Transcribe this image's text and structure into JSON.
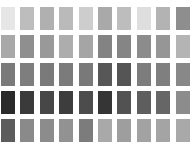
{
  "grid": {
    "rows": 5,
    "columns": 10,
    "swatches": [
      [
        "#e6e6e6",
        "#bdbdbd",
        "#b0b0b0",
        "#bababa",
        "#cdcdcd",
        "#a9a9a9",
        "#bdbdbd",
        "#dedede",
        "#b3b3b3",
        "#8e8e8e"
      ],
      [
        "#a8a8a8",
        "#8f8f8f",
        "#999999",
        "#adadad",
        "#a5a5a5",
        "#838383",
        "#858585",
        "#8c8c8c",
        "#969696",
        "#b4b4b4"
      ],
      [
        "#7a7a7a",
        "#7e7e7e",
        "#7a7a7a",
        "#7b7b7b",
        "#797979",
        "#575757",
        "#555555",
        "#7c7c7c",
        "#7f7f7f",
        "#888888"
      ],
      [
        "#2a2a2a",
        "#3a3a3a",
        "#474747",
        "#3d3d3d",
        "#4c4c4c",
        "#353535",
        "#525252",
        "#5e5e5e",
        "#666666",
        "#8c8c8c"
      ],
      [
        "#5c5c5c",
        "#8a8a8a",
        "#8c8c8c",
        "#929292",
        "#7c7c7c",
        "#a9a9a9",
        "#9e9e9e",
        "#a2a2a2",
        "#a4a4a4",
        "#a9a9a9"
      ]
    ]
  }
}
